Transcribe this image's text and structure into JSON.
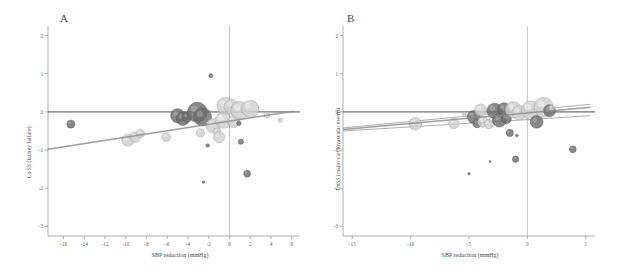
{
  "figure": {
    "title": "",
    "panels": [
      "A",
      "B"
    ]
  },
  "panel_a": {
    "letter": "A",
    "xlabel": "SBP reduction  (mmHg)",
    "ylabel": "Ln SS (kidney failure)"
  },
  "panel_b": {
    "letter": "B",
    "xlabel": "SBP reduction  (mmHg)",
    "ylabel": "LnSS (major cardiovascular events)"
  },
  "chart_data": [
    {
      "type": "scatter",
      "title": "A",
      "xlabel": "SBP reduction  (mmHg)",
      "ylabel": "Ln SS (kidney failure)",
      "xlim": [
        -17.5,
        6.8
      ],
      "ylim": [
        -3.25,
        2.25
      ],
      "xticks": [
        -16,
        -14,
        -12,
        -10,
        -8,
        -6,
        -4,
        -2,
        0,
        2,
        4,
        6
      ],
      "xticklabels": [
        "-16",
        "-14",
        "-12",
        "-10",
        "-8",
        "-6",
        "-4",
        "-2",
        "0",
        "2",
        "4",
        "6"
      ],
      "yticks": [
        2,
        1,
        0,
        -1,
        -2,
        -3
      ],
      "yticklabels": [
        "2",
        "1",
        "0",
        "-1",
        "-2",
        "-3"
      ],
      "grid": false,
      "legend": "none",
      "reference_lines": {
        "horizontal_zero_y": 0,
        "vertical_zero_x": 0
      },
      "regression_line": {
        "label": "fitted meta-regression",
        "x_start": -17.5,
        "y_start": -0.98,
        "x_end": 6.2,
        "y_end": 0.02,
        "color": "#8c8c8c"
      },
      "bubbles": [
        {
          "x": -15.3,
          "y": -0.32,
          "size": 4.0,
          "shade": "dark"
        },
        {
          "x": -9.8,
          "y": -0.74,
          "size": 6.0,
          "shade": "light"
        },
        {
          "x": -9.1,
          "y": -0.66,
          "size": 5.2,
          "shade": "light"
        },
        {
          "x": -8.6,
          "y": -0.57,
          "size": 4.2,
          "shade": "light"
        },
        {
          "x": -6.1,
          "y": -0.66,
          "size": 4.4,
          "shade": "light"
        },
        {
          "x": -5.0,
          "y": -0.1,
          "size": 7.0,
          "shade": "dark"
        },
        {
          "x": -4.5,
          "y": -0.18,
          "size": 6.6,
          "shade": "dark"
        },
        {
          "x": -4.1,
          "y": -0.14,
          "size": 5.0,
          "shade": "dark"
        },
        {
          "x": -3.1,
          "y": -0.01,
          "size": 10.0,
          "shade": "dark"
        },
        {
          "x": -2.6,
          "y": -0.13,
          "size": 9.0,
          "shade": "dark"
        },
        {
          "x": -2.8,
          "y": -0.55,
          "size": 4.2,
          "shade": "light"
        },
        {
          "x": -2.1,
          "y": -0.88,
          "size": 1.8,
          "shade": "dark"
        },
        {
          "x": -1.8,
          "y": 0.95,
          "size": 2.0,
          "shade": "dark"
        },
        {
          "x": -1.6,
          "y": -0.36,
          "size": 7.0,
          "shade": "light"
        },
        {
          "x": -1.2,
          "y": -0.52,
          "size": 4.0,
          "shade": "light"
        },
        {
          "x": -1.0,
          "y": -0.66,
          "size": 5.6,
          "shade": "light"
        },
        {
          "x": -0.6,
          "y": -0.22,
          "size": 8.0,
          "shade": "light"
        },
        {
          "x": -0.4,
          "y": 0.16,
          "size": 8.4,
          "shade": "light"
        },
        {
          "x": 0.2,
          "y": 0.14,
          "size": 7.4,
          "shade": "light"
        },
        {
          "x": 0.4,
          "y": -0.25,
          "size": 6.0,
          "shade": "light"
        },
        {
          "x": 0.9,
          "y": -0.3,
          "size": 2.2,
          "shade": "dark"
        },
        {
          "x": 1.0,
          "y": 0.04,
          "size": 9.0,
          "shade": "light"
        },
        {
          "x": 1.1,
          "y": -0.78,
          "size": 2.6,
          "shade": "dark"
        },
        {
          "x": 1.7,
          "y": -1.62,
          "size": 3.4,
          "shade": "dark"
        },
        {
          "x": 2.0,
          "y": 0.08,
          "size": 8.6,
          "shade": "light"
        },
        {
          "x": 3.6,
          "y": -0.08,
          "size": 3.0,
          "shade": "light"
        },
        {
          "x": 4.9,
          "y": -0.22,
          "size": 2.0,
          "shade": "light"
        },
        {
          "x": -2.5,
          "y": -1.84,
          "size": 1.2,
          "shade": "dark"
        }
      ]
    },
    {
      "type": "scatter",
      "title": "B",
      "xlabel": "SBP reduction  (mmHg)",
      "ylabel": "LnSS (major cardiovascular events)",
      "xlim": [
        -15.8,
        5.8
      ],
      "ylim": [
        -3.25,
        2.25
      ],
      "xticks": [
        -15,
        -10,
        -5,
        0,
        5
      ],
      "xticklabels": [
        "-15",
        "-10",
        "-5",
        "0",
        "5"
      ],
      "yticks": [
        2,
        1,
        0,
        -1,
        -2,
        -3
      ],
      "yticklabels": [
        "2",
        "1",
        "0",
        "-1",
        "-2",
        "-3"
      ],
      "grid": false,
      "legend": "none",
      "reference_lines": {
        "horizontal_zero_y": 0,
        "vertical_zero_x": 0
      },
      "regression_line": {
        "label": "fitted meta-regression",
        "x_start": -15.8,
        "y_start": -0.46,
        "x_end": 5.4,
        "y_end": 0.12,
        "color": "#8c8c8c"
      },
      "confidence_band": {
        "upper_end_y": 0.2,
        "lower_end_y": -0.1
      },
      "bubbles": [
        {
          "x": -9.6,
          "y": -0.31,
          "size": 6.2,
          "shade": "light"
        },
        {
          "x": -6.3,
          "y": -0.3,
          "size": 5.2,
          "shade": "light"
        },
        {
          "x": -5.4,
          "y": -0.05,
          "size": 2.0,
          "shade": "light"
        },
        {
          "x": -4.6,
          "y": -0.13,
          "size": 6.4,
          "shade": "dark"
        },
        {
          "x": -4.3,
          "y": -0.3,
          "size": 4.4,
          "shade": "dark"
        },
        {
          "x": -4.0,
          "y": 0.05,
          "size": 6.0,
          "shade": "light"
        },
        {
          "x": -3.8,
          "y": -0.26,
          "size": 5.4,
          "shade": "light"
        },
        {
          "x": -3.3,
          "y": -0.32,
          "size": 4.6,
          "shade": "light"
        },
        {
          "x": -3.0,
          "y": -0.2,
          "size": 3.0,
          "shade": "light"
        },
        {
          "x": -2.8,
          "y": 0.03,
          "size": 7.6,
          "shade": "dark"
        },
        {
          "x": -2.4,
          "y": -0.22,
          "size": 6.8,
          "shade": "dark"
        },
        {
          "x": -2.0,
          "y": 0.07,
          "size": 6.4,
          "shade": "dark"
        },
        {
          "x": -1.8,
          "y": -0.18,
          "size": 5.0,
          "shade": "dark"
        },
        {
          "x": -1.5,
          "y": -0.55,
          "size": 3.6,
          "shade": "dark"
        },
        {
          "x": -1.2,
          "y": 0.06,
          "size": 8.0,
          "shade": "light"
        },
        {
          "x": -1.0,
          "y": -1.24,
          "size": 3.2,
          "shade": "dark"
        },
        {
          "x": -0.7,
          "y": -0.02,
          "size": 7.2,
          "shade": "light"
        },
        {
          "x": 0.3,
          "y": 0.04,
          "size": 9.4,
          "shade": "light"
        },
        {
          "x": 0.8,
          "y": -0.26,
          "size": 6.4,
          "shade": "dark"
        },
        {
          "x": 1.4,
          "y": 0.12,
          "size": 9.8,
          "shade": "light"
        },
        {
          "x": 1.9,
          "y": 0.03,
          "size": 6.0,
          "shade": "dark"
        },
        {
          "x": 2.1,
          "y": 0.1,
          "size": 3.0,
          "shade": "light"
        },
        {
          "x": 3.9,
          "y": -0.98,
          "size": 3.4,
          "shade": "dark"
        },
        {
          "x": -0.9,
          "y": -0.62,
          "size": 1.4,
          "shade": "dark"
        },
        {
          "x": -5.0,
          "y": -1.62,
          "size": 1.2,
          "shade": "dark"
        },
        {
          "x": -3.2,
          "y": -1.3,
          "size": 1.0,
          "shade": "dark"
        }
      ]
    }
  ],
  "colors": {
    "bubble_light": "#cfcfcf",
    "bubble_dark": "#6e6e6e",
    "axis": "#8d8d8d",
    "reference": "#3a3a3a",
    "regression": "#8c8c8c",
    "background": "#fefefe"
  }
}
